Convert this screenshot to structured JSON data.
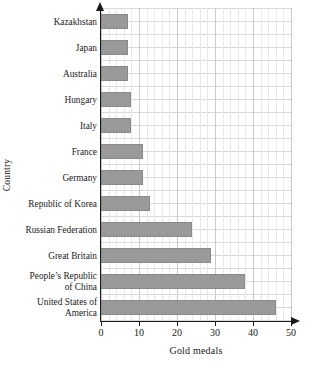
{
  "chart_data": {
    "type": "bar",
    "orientation": "horizontal",
    "title": "",
    "xlabel": "Gold medals",
    "ylabel": "Country",
    "xlim": [
      0,
      50
    ],
    "xticks": [
      0,
      10,
      20,
      30,
      40,
      50
    ],
    "grid": true,
    "grid_minor_step": 2,
    "grid_major_step": 10,
    "legend": null,
    "categories": [
      "Kazakhstan",
      "Japan",
      "Australia",
      "Hungary",
      "Italy",
      "France",
      "Germany",
      "Republic of Korea",
      "Russian Federation",
      "Great Britain",
      "People's Republic of China",
      "United States of America"
    ],
    "category_label_lines": [
      [
        "Kazakhstan"
      ],
      [
        "Japan"
      ],
      [
        "Australia"
      ],
      [
        "Hungary"
      ],
      [
        "Italy"
      ],
      [
        "France"
      ],
      [
        "Germany"
      ],
      [
        "Republic of Korea"
      ],
      [
        "Russian Federation"
      ],
      [
        "Great Britain"
      ],
      [
        "People’s Republic",
        "of China"
      ],
      [
        "United States of",
        "America"
      ]
    ],
    "values": [
      7,
      7,
      7,
      8,
      8,
      11,
      11,
      13,
      24,
      29,
      38,
      46
    ],
    "bar_color": "#9a9a9a",
    "bar_edge_color": "#8a8a8a",
    "axis_color": "#1a1a1a",
    "grid_major_color": "#c9c9c9",
    "grid_minor_color": "#e8e8e8"
  }
}
